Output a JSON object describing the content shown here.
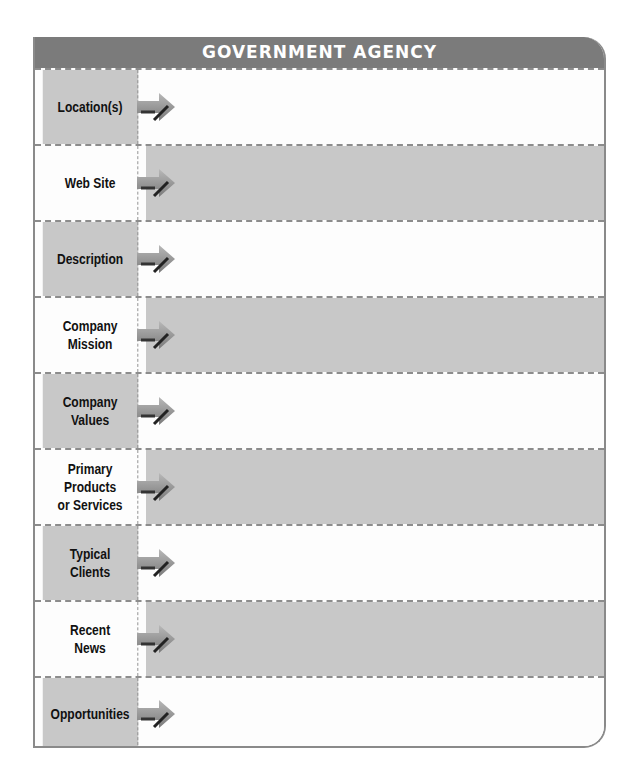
{
  "title": "GOVERNMENT AGENCY",
  "colors": {
    "header": "#7b7b7b",
    "shaded_cell": "#c8c8c8",
    "light_cell": "#fdfdfd",
    "border": "#8c8c8c"
  },
  "rows": [
    {
      "label": "Location(s)",
      "value": "",
      "label_shaded": true
    },
    {
      "label": "Web Site",
      "value": "",
      "label_shaded": false
    },
    {
      "label": "Description",
      "value": "",
      "label_shaded": true
    },
    {
      "label": "Company\nMission",
      "value": "",
      "label_shaded": false
    },
    {
      "label": "Company\nValues",
      "value": "",
      "label_shaded": true
    },
    {
      "label": "Primary\nProducts\nor Services",
      "value": "",
      "label_shaded": false
    },
    {
      "label": "Typical\nClients",
      "value": "",
      "label_shaded": true
    },
    {
      "label": "Recent\nNews",
      "value": "",
      "label_shaded": false
    },
    {
      "label": "Opportunities",
      "value": "",
      "label_shaded": true
    }
  ],
  "icons": {
    "row_arrow": "arrow-right-icon"
  }
}
